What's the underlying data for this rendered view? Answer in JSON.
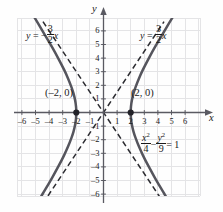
{
  "chart_data": {
    "type": "line",
    "title": "",
    "xlabel": "x",
    "ylabel": "y",
    "xlim": [
      -6.4,
      6.4
    ],
    "ylim": [
      -6.4,
      6.4
    ],
    "grid": true,
    "legend": "none",
    "equation_text": "x^2/4 - y^2/9 = 1",
    "conic": {
      "kind": "hyperbola",
      "orientation": "horizontal",
      "a": 2,
      "b": 3,
      "center": [
        0,
        0
      ],
      "vertices": [
        [
          -2,
          0
        ],
        [
          2,
          0
        ]
      ],
      "asymptote_slopes": [
        1.5,
        -1.5
      ]
    },
    "x_ticks": [
      -6,
      -5,
      -4,
      -3,
      -2,
      -1,
      1,
      2,
      3,
      4,
      5,
      6
    ],
    "y_ticks": [
      -6,
      -5,
      -4,
      -3,
      -2,
      -1,
      1,
      2,
      3,
      4,
      5,
      6
    ],
    "x_tick_labels": [
      "-6",
      "-5",
      "-4",
      "-3",
      "-2",
      "-1",
      "1",
      "2",
      "3",
      "4",
      "5",
      "6"
    ],
    "y_tick_labels": [
      "-6",
      "-5",
      "-4",
      "-3",
      "-2",
      "-1",
      "1",
      "2",
      "3",
      "4",
      "5",
      "6"
    ],
    "series": [
      {
        "name": "right-branch",
        "style": "solid",
        "color": "#55555d",
        "points": [
          [
            6.05,
            8.55
          ],
          [
            5.0,
            6.87
          ],
          [
            4.4,
            5.86
          ],
          [
            3.8,
            4.84
          ],
          [
            3.3,
            3.93
          ],
          [
            2.9,
            3.15
          ],
          [
            2.6,
            2.49
          ],
          [
            2.35,
            1.85
          ],
          [
            2.2,
            1.39
          ],
          [
            2.08,
            0.87
          ],
          [
            2.02,
            0.43
          ],
          [
            2.0,
            0.0
          ],
          [
            2.02,
            -0.43
          ],
          [
            2.08,
            -0.87
          ],
          [
            2.2,
            -1.39
          ],
          [
            2.35,
            -1.85
          ],
          [
            2.6,
            -2.49
          ],
          [
            2.9,
            -3.15
          ],
          [
            3.3,
            -3.93
          ],
          [
            3.8,
            -4.84
          ],
          [
            4.4,
            -5.86
          ],
          [
            5.0,
            -6.87
          ],
          [
            6.05,
            -8.55
          ]
        ]
      },
      {
        "name": "left-branch",
        "style": "solid",
        "color": "#55555d",
        "points": [
          [
            -6.05,
            8.55
          ],
          [
            -5.0,
            6.87
          ],
          [
            -4.4,
            5.86
          ],
          [
            -3.8,
            4.84
          ],
          [
            -3.3,
            3.93
          ],
          [
            -2.9,
            3.15
          ],
          [
            -2.6,
            2.49
          ],
          [
            -2.35,
            1.85
          ],
          [
            -2.2,
            1.39
          ],
          [
            -2.08,
            0.87
          ],
          [
            -2.02,
            0.43
          ],
          [
            -2.0,
            0.0
          ],
          [
            -2.02,
            -0.43
          ],
          [
            -2.08,
            -0.87
          ],
          [
            -2.2,
            -1.39
          ],
          [
            -2.35,
            -1.85
          ],
          [
            -2.6,
            -2.49
          ],
          [
            -2.9,
            -3.15
          ],
          [
            -3.3,
            -3.93
          ],
          [
            -3.8,
            -4.84
          ],
          [
            -4.4,
            -5.86
          ],
          [
            -5.0,
            -6.87
          ],
          [
            -6.05,
            -8.55
          ]
        ]
      },
      {
        "name": "asymptote-positive",
        "style": "dashed",
        "color": "#2b2b30",
        "points": [
          [
            -4.45,
            -6.68
          ],
          [
            4.45,
            6.68
          ]
        ]
      },
      {
        "name": "asymptote-negative",
        "style": "dashed",
        "color": "#2b2b30",
        "points": [
          [
            -4.45,
            6.68
          ],
          [
            4.45,
            -6.68
          ]
        ]
      }
    ],
    "annotations": [
      {
        "name": "asymptote-label-left",
        "text": "y = -3/2 x",
        "at": [
          -4.6,
          6.9
        ]
      },
      {
        "name": "asymptote-label-right",
        "text": "y = 3/2 x",
        "at": [
          2.9,
          6.9
        ]
      },
      {
        "name": "vertex-label-left",
        "text": "(-2, 0)",
        "at": [
          -3.6,
          1.3
        ]
      },
      {
        "name": "vertex-label-right",
        "text": "(2, 0)",
        "at": [
          2.2,
          1.3
        ]
      },
      {
        "name": "conic-equation",
        "text": "x^2/4 - y^2/9 = 1",
        "at": [
          3.0,
          -2.0
        ]
      }
    ],
    "markers": [
      {
        "name": "vertex-point-left",
        "point": [
          -2,
          0
        ],
        "style": "filled-circle",
        "color": "#222228"
      },
      {
        "name": "vertex-point-right",
        "point": [
          2,
          0
        ],
        "style": "filled-circle",
        "color": "#222228"
      }
    ],
    "colors": {
      "curve": "#55555d",
      "asymptote": "#2b2b30",
      "axis": "#5a5a62",
      "grid": "#e4e4e6",
      "background": "#fefefe",
      "text": "#1a1a1a"
    }
  },
  "labels": {
    "axis_x": "x",
    "axis_y": "y",
    "asymptote_left": {
      "lhs": "y",
      "eq": "=",
      "sign": "−",
      "num": "3",
      "den": "2",
      "var": "x"
    },
    "asymptote_right": {
      "lhs": "y",
      "eq": "=",
      "sign": "",
      "num": "3",
      "den": "2",
      "var": "x"
    },
    "vertex_left": "(–2, 0)",
    "vertex_right": "(2, 0)",
    "equation": {
      "num1_base": "x",
      "num1_exp": "2",
      "den1": "4",
      "minus": "−",
      "num2_base": "y",
      "num2_exp": "2",
      "den2": "9",
      "equals": "= 1"
    }
  }
}
